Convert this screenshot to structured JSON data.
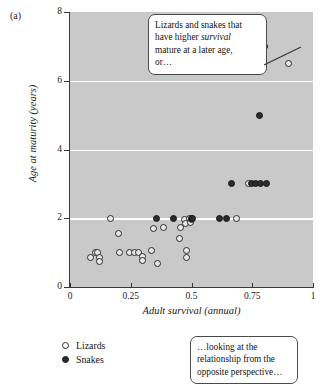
{
  "panel": {
    "label": "(a)"
  },
  "axes": {
    "x": {
      "title": "Adult survival (annual)",
      "ticks": [
        "0",
        "0.25",
        "0.5",
        "0.75",
        "1"
      ],
      "tick_values": [
        0,
        0.25,
        0.5,
        0.75,
        1
      ],
      "min": 0,
      "max": 1
    },
    "y": {
      "title": "Age at maturity (years)",
      "ticks": [
        "0",
        "2",
        "4",
        "6",
        "8"
      ],
      "tick_values": [
        0,
        2,
        4,
        6,
        8
      ],
      "min": 0,
      "max": 8
    }
  },
  "legend": {
    "items": [
      {
        "label": "Lizards",
        "marker": "open-circle"
      },
      {
        "label": "Snakes",
        "marker": "filled-circle"
      }
    ]
  },
  "callouts": {
    "top": {
      "line1": "Lizards and snakes that",
      "line2_pre": "have higher ",
      "line2_em": "survival",
      "line3": "mature at a later age,",
      "line4": "or…"
    },
    "bottom": {
      "line1": "…looking at the",
      "line2": "relationship from the",
      "line3": "opposite perspective…"
    }
  },
  "colors": {
    "plot_background": "#c9c9c9",
    "gridline": "#ffffff",
    "snake_marker": "#2b2b2b",
    "lizard_marker": "#e8e8e8",
    "axis": "#3a3a3a"
  },
  "chart_data": {
    "type": "scatter",
    "title": "",
    "xlabel": "Adult survival (annual)",
    "ylabel": "Age at maturity (years)",
    "xlim": [
      0,
      1
    ],
    "ylim": [
      0,
      8
    ],
    "grid": true,
    "gridlines_y": [
      2,
      4,
      6
    ],
    "legend_position": "below-left",
    "series": [
      {
        "name": "Lizards",
        "marker": "open-circle",
        "points": [
          [
            0.085,
            0.85
          ],
          [
            0.105,
            1.0
          ],
          [
            0.115,
            1.0
          ],
          [
            0.12,
            0.85
          ],
          [
            0.12,
            0.75
          ],
          [
            0.165,
            2.0
          ],
          [
            0.2,
            1.55
          ],
          [
            0.205,
            1.0
          ],
          [
            0.245,
            1.0
          ],
          [
            0.265,
            1.0
          ],
          [
            0.28,
            1.0
          ],
          [
            0.3,
            0.9
          ],
          [
            0.3,
            0.78
          ],
          [
            0.335,
            1.05
          ],
          [
            0.345,
            1.7
          ],
          [
            0.36,
            0.68
          ],
          [
            0.385,
            1.72
          ],
          [
            0.45,
            1.4
          ],
          [
            0.455,
            1.72
          ],
          [
            0.47,
            1.95
          ],
          [
            0.475,
            1.85
          ],
          [
            0.48,
            1.05
          ],
          [
            0.48,
            0.85
          ],
          [
            0.49,
            2.0
          ],
          [
            0.495,
            1.88
          ],
          [
            0.5,
            1.95
          ],
          [
            0.685,
            2.0
          ],
          [
            0.735,
            3.0
          ],
          [
            0.9,
            6.5
          ]
        ]
      },
      {
        "name": "Snakes",
        "marker": "filled-circle",
        "points": [
          [
            0.355,
            2.0
          ],
          [
            0.425,
            2.0
          ],
          [
            0.5,
            2.0
          ],
          [
            0.505,
            2.0
          ],
          [
            0.615,
            2.0
          ],
          [
            0.645,
            2.0
          ],
          [
            0.665,
            3.0
          ],
          [
            0.745,
            3.0
          ],
          [
            0.765,
            3.0
          ],
          [
            0.785,
            3.0
          ],
          [
            0.81,
            3.0
          ],
          [
            0.78,
            5.0
          ],
          [
            0.8,
            7.0
          ]
        ]
      }
    ]
  }
}
